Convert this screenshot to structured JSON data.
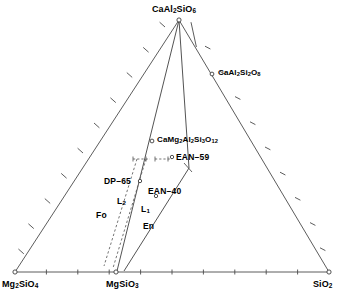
{
  "figure": {
    "type": "ternary-phase-diagram",
    "background_color": "#ffffff",
    "line_color": "#3a3a3a",
    "text_color": "#000000"
  },
  "apexes": {
    "top": {
      "label": "CaAl2SiO6",
      "html": "CaAl<sub>2</sub>SiO<sub>6</sub>"
    },
    "bottom_left": {
      "label": "Mg2SiO4",
      "html": "Mg<sub>2</sub>SiO<sub>4</sub>"
    },
    "bottom_right": {
      "label": "SiO2",
      "html": "SiO<sub>2</sub>"
    }
  },
  "edge_points": {
    "bottom_center": {
      "label": "MgSiO3",
      "html": "MgSiO<sub>3</sub>"
    },
    "right_edge": {
      "label": "CaAl2Si2O8",
      "html": "CaAl<sub>2</sub>Si<sub>2</sub>O<sub>8</sub>"
    }
  },
  "interior_points": [
    {
      "label": "CaMg2Al2Si3O12",
      "html": "CaMg<sub>2</sub>Al<sub>2</sub>Si<sub>3</sub>O<sub>12</sub>"
    },
    {
      "label": "EAN-59",
      "html": "EAN&#8211;59"
    },
    {
      "label": "EAN-40",
      "html": "EAN&#8211;40"
    },
    {
      "label": "DP-65",
      "html": "DP&#8211;65"
    }
  ],
  "field_labels": [
    {
      "label": "Fo",
      "html": "Fo"
    },
    {
      "label": "L2",
      "html": "L<sub>2</sub>"
    },
    {
      "label": "L1",
      "html": "L<sub>1</sub>"
    },
    {
      "label": "En",
      "html": "En"
    }
  ],
  "chart_data": {
    "type": "scatter",
    "title": "",
    "xlabel": "",
    "ylabel": "",
    "components": [
      "Mg2SiO4",
      "SiO2",
      "CaAl2SiO6"
    ],
    "tick_count_per_edge": 10,
    "grid": false,
    "legend": "none",
    "annotations": [
      "CaAl2SiO6",
      "Mg2SiO4",
      "SiO2",
      "MgSiO3",
      "CaAl2Si2O8",
      "CaMg2Al2Si3O12",
      "EAN-59",
      "EAN-40",
      "DP-65",
      "Fo",
      "L2",
      "L1",
      "En"
    ],
    "points": [
      {
        "name": "CaAl2SiO6",
        "px": 179,
        "py": 20,
        "marker": "open-circle"
      },
      {
        "name": "Mg2SiO4",
        "px": 15,
        "py": 272,
        "marker": "open-circle"
      },
      {
        "name": "SiO2",
        "px": 329,
        "py": 272,
        "marker": "open-circle"
      },
      {
        "name": "MgSiO3",
        "px": 116,
        "py": 272,
        "marker": "open-circle"
      },
      {
        "name": "CaAl2Si2O8",
        "px": 212,
        "py": 74,
        "marker": "open-circle"
      },
      {
        "name": "CaMg2Al2Si3O12",
        "px": 152,
        "py": 141,
        "marker": "open-circle"
      },
      {
        "name": "EAN-59",
        "px": 171,
        "py": 157,
        "marker": "open-circle"
      },
      {
        "name": "EAN-40",
        "px": 156,
        "py": 196,
        "marker": "open-circle"
      },
      {
        "name": "DP-65",
        "px": 140,
        "py": 181,
        "marker": "open-circle"
      }
    ],
    "boundary_lines": [
      {
        "name": "CaAl2SiO6-MgSiO3",
        "style": "solid"
      },
      {
        "name": "CaAl2SiO6-En-boundary",
        "style": "solid"
      },
      {
        "name": "Fo-L2 boundary",
        "style": "dashed"
      },
      {
        "name": "L2-L1 boundary",
        "style": "dashed"
      }
    ]
  }
}
